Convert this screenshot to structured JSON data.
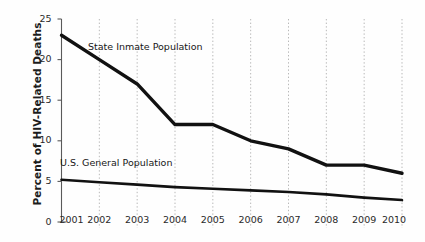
{
  "chart_data": {
    "type": "line",
    "title": "",
    "subtitle": "",
    "xlabel": "",
    "ylabel": "Percent of HIV-Related Deaths",
    "x": [
      2001,
      2002,
      2003,
      2004,
      2005,
      2006,
      2007,
      2008,
      2009,
      2010
    ],
    "xtick_labels": [
      "2001",
      "2002",
      "2003",
      "2004",
      "2005",
      "2006",
      "2007",
      "2008",
      "2009",
      "2010"
    ],
    "ytick_labels": [
      "0",
      "5",
      "10",
      "15",
      "20",
      "25"
    ],
    "yticks": [
      0,
      5,
      10,
      15,
      20,
      25
    ],
    "ylim": [
      0,
      25
    ],
    "xlim": [
      2001,
      2010
    ],
    "grid": "vertical-dotted",
    "legend": "inline-labels",
    "series": [
      {
        "name": "State Inmate Population",
        "values": [
          23,
          20,
          17,
          12,
          12,
          10,
          9,
          7,
          7,
          6
        ],
        "color": "#111111",
        "line_width": 3.4
      },
      {
        "name": "U.S. General Population",
        "values": [
          5.2,
          4.9,
          4.6,
          4.3,
          4.1,
          3.9,
          3.7,
          3.4,
          3.0,
          2.7
        ],
        "color": "#111111",
        "line_width": 2.6
      }
    ],
    "annotations": [
      {
        "text": "State Inmate Population",
        "x": 2002.1,
        "y": 21.3
      },
      {
        "text": "U.S. General Population",
        "x": 2001.1,
        "y": 7.3
      }
    ],
    "colors": {
      "background": "#fefefe",
      "axis": "#5a5a5a",
      "gridline": "#b8b8b8",
      "tick_label": "#2a2a2a",
      "axis_title": "#1c1c1c",
      "series_line": "#111111"
    }
  },
  "axis": {
    "y_title": "Percent of HIV-Related Deaths"
  },
  "labels": {
    "inmate": "State Inmate Population",
    "general": "U.S. General Population"
  }
}
